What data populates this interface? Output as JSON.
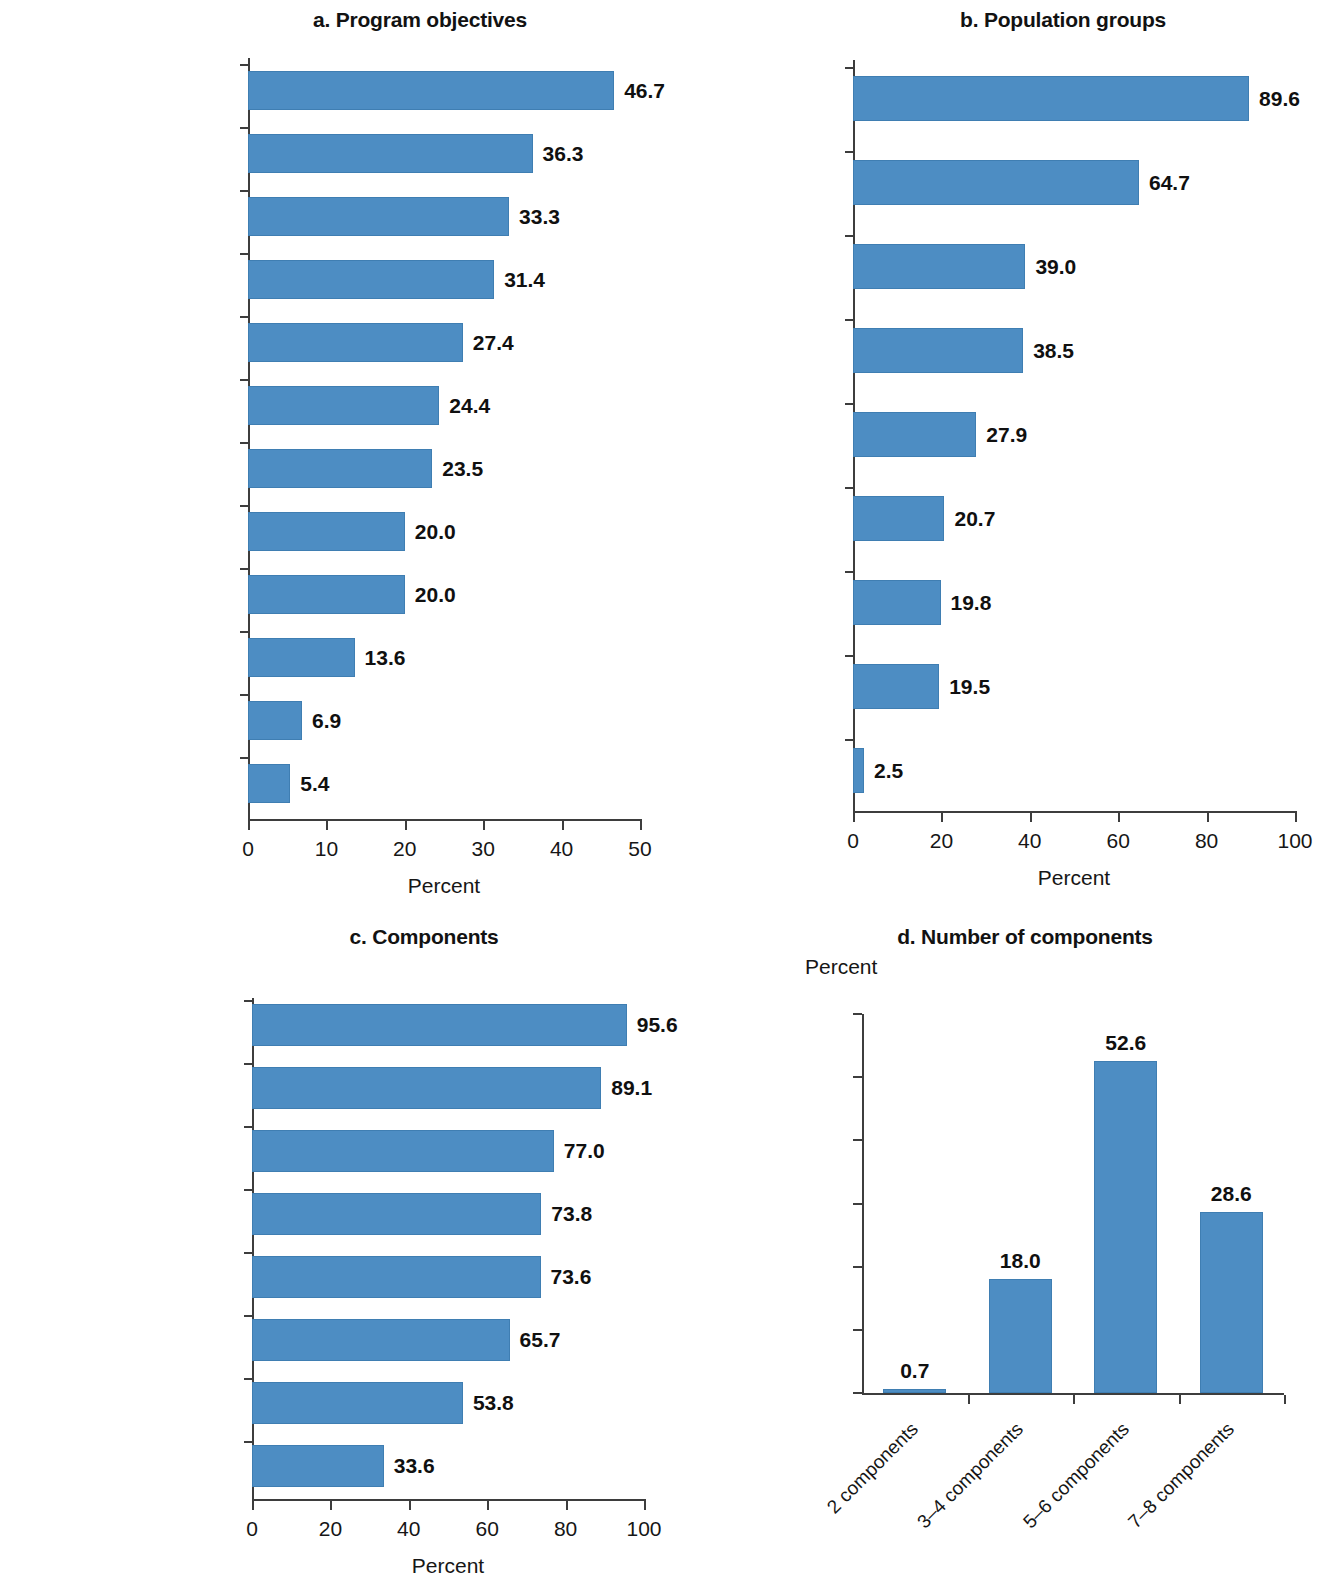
{
  "figure": {
    "bar_color": "#4d8dc3",
    "axis_color": "#3d3d3d"
  },
  "panels": {
    "a": {
      "title": "a. Program objectives",
      "xlabel": "Percent",
      "xticks": [
        "0",
        "10",
        "20",
        "30",
        "40",
        "50"
      ]
    },
    "b": {
      "title": "b. Population groups",
      "xlabel": "Percent",
      "xticks": [
        "0",
        "20",
        "40",
        "60",
        "80",
        "100"
      ]
    },
    "c": {
      "title": "c. Components",
      "xlabel": "Percent",
      "xticks": [
        "0",
        "20",
        "40",
        "60",
        "80",
        "100"
      ]
    },
    "d": {
      "title": "d. Number of components",
      "ylabel": "Percent",
      "yticks": [
        "0",
        "10",
        "20",
        "30",
        "40",
        "50",
        "60"
      ]
    }
  },
  "chart_data": [
    {
      "type": "bar",
      "orientation": "horizontal",
      "panel": "a",
      "title": "a. Program objectives",
      "xlabel": "Percent",
      "ylabel": "",
      "xlim": [
        0,
        50
      ],
      "grid": false,
      "legend": null,
      "categories": [
        "Enhanced\nself-employment\nopportunity",
        "Income diversification",
        "Women’s\nempowerment",
        "Increased productivity",
        "Financial inclusion",
        "Food security",
        "Enhanced market\naccess",
        "Climate resilience",
        "Social inclusion",
        "Increased access to\nwage employment",
        "Enhanced access\nto social services",
        "Social cohesion"
      ],
      "values": [
        46.7,
        36.3,
        33.3,
        31.4,
        27.4,
        24.4,
        23.5,
        20.0,
        20.0,
        13.6,
        6.9,
        5.4
      ],
      "labels": [
        "46.7",
        "36.3",
        "33.3",
        "31.4",
        "27.4",
        "24.4",
        "23.5",
        "20.0",
        "20.0",
        "13.6",
        "6.9",
        "5.4"
      ]
    },
    {
      "type": "bar",
      "orientation": "horizontal",
      "panel": "b",
      "title": "b. Population groups",
      "xlabel": "Percent",
      "ylabel": "",
      "xlim": [
        0,
        100
      ],
      "grid": false,
      "legend": null,
      "categories": [
        "Women",
        "Youth",
        "Displacement/\nconflict affected",
        "People with\ndisabilities",
        "Climate affected",
        "Children",
        "Elderly",
        "Marginalized",
        "Other"
      ],
      "values": [
        89.6,
        64.7,
        39.0,
        38.5,
        27.9,
        20.7,
        19.8,
        19.5,
        2.5
      ],
      "labels": [
        "89.6",
        "64.7",
        "39.0",
        "38.5",
        "27.9",
        "20.7",
        "19.8",
        "19.5",
        "2.5"
      ]
    },
    {
      "type": "bar",
      "orientation": "horizontal",
      "panel": "c",
      "title": "c. Components",
      "xlabel": "Percent",
      "ylabel": "",
      "xlim": [
        0,
        100
      ],
      "grid": false,
      "legend": null,
      "categories": [
        "Skills training",
        "Coaching",
        "Business capital",
        "Market links",
        "Financial services\nfacilitation",
        "Climate resilience",
        "Transfer",
        "Access to wage\nemployment"
      ],
      "values": [
        95.6,
        89.1,
        77.0,
        73.8,
        73.6,
        65.7,
        53.8,
        33.6
      ],
      "labels": [
        "95.6",
        "89.1",
        "77.0",
        "73.8",
        "73.6",
        "65.7",
        "53.8",
        "33.6"
      ]
    },
    {
      "type": "bar",
      "orientation": "vertical",
      "panel": "d",
      "title": "d. Number of components",
      "xlabel": "",
      "ylabel": "Percent",
      "ylim": [
        0,
        60
      ],
      "grid": false,
      "legend": null,
      "categories": [
        "2 components",
        "3–4 components",
        "5–6 components",
        "7–8 components"
      ],
      "values": [
        0.7,
        18.0,
        52.6,
        28.6
      ],
      "labels": [
        "0.7",
        "18.0",
        "52.6",
        "28.6"
      ]
    }
  ]
}
